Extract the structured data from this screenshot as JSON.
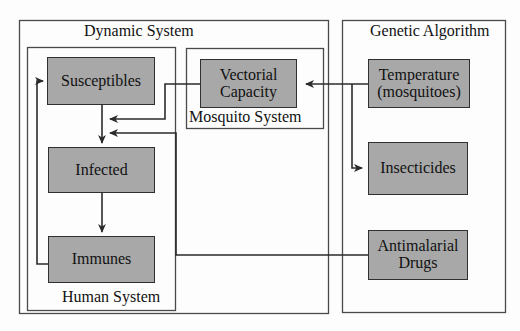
{
  "diagram": {
    "colors": {
      "node_fill": "#a8a8a8",
      "node_border": "#303030",
      "line": "#4a4a4a",
      "background": "#fdfdfd"
    },
    "groups": [
      {
        "id": "dynamic-system",
        "label": "Dynamic System"
      },
      {
        "id": "human-system",
        "label": "Human System"
      },
      {
        "id": "mosquito-system",
        "label": "Mosquito System"
      },
      {
        "id": "genetic-algorithm",
        "label": "Genetic Algorithm"
      }
    ],
    "nodes": [
      {
        "id": "susceptibles",
        "label": "Susceptibles",
        "label2": ""
      },
      {
        "id": "infected",
        "label": "Infected",
        "label2": ""
      },
      {
        "id": "immunes",
        "label": "Immunes",
        "label2": ""
      },
      {
        "id": "vectorial-capacity",
        "label": "Vectorial",
        "label2": "Capacity"
      },
      {
        "id": "temperature",
        "label": "Temperature",
        "label2": "(mosquitoes)"
      },
      {
        "id": "insecticides",
        "label": "Insecticides",
        "label2": ""
      },
      {
        "id": "antimalarial-drugs",
        "label": "Antimalarial",
        "label2": "Drugs"
      }
    ],
    "edges": [
      {
        "from": "susceptibles",
        "to": "infected",
        "arrow": "down"
      },
      {
        "from": "infected",
        "to": "immunes",
        "arrow": "down"
      },
      {
        "from": "immunes",
        "to": "susceptibles",
        "arrow": "right"
      },
      {
        "from": "vectorial-capacity",
        "to": "infected",
        "arrow": "left"
      },
      {
        "from": "antimalarial-drugs",
        "to": "infected",
        "arrow": "left"
      },
      {
        "from": "temperature",
        "to": "vectorial-capacity",
        "arrow": "left"
      },
      {
        "from": "temperature",
        "to": "insecticides",
        "arrow": "down"
      }
    ]
  }
}
